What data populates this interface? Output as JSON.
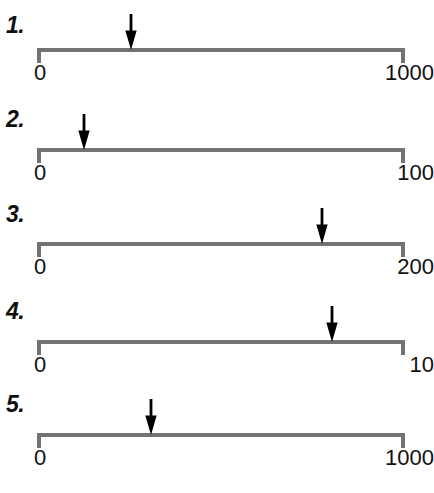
{
  "worksheet": {
    "title": "Estimate the number marked by the arrow on each number line",
    "line_color": "#737373",
    "arrow_color": "#000000",
    "text_color": "#121212"
  },
  "chart_data": {
    "type": "number-line",
    "xlabel": "",
    "ylabel": "",
    "grid": false,
    "legend": null,
    "items": [
      {
        "index": "1.",
        "start_label": "0",
        "end_label": "1000",
        "min": 0,
        "max": 1000,
        "arrow_fraction": 0.255,
        "arrow_value": 255
      },
      {
        "index": "2.",
        "start_label": "0",
        "end_label": "100",
        "min": 0,
        "max": 100,
        "arrow_fraction": 0.128,
        "arrow_value": 13
      },
      {
        "index": "3.",
        "start_label": "0",
        "end_label": "200",
        "min": 0,
        "max": 200,
        "arrow_fraction": 0.774,
        "arrow_value": 155
      },
      {
        "index": "4.",
        "start_label": "0",
        "end_label": "10",
        "min": 0,
        "max": 10,
        "arrow_fraction": 0.802,
        "arrow_value": 8
      },
      {
        "index": "5.",
        "start_label": "0",
        "end_label": "1000",
        "min": 0,
        "max": 1000,
        "arrow_fraction": 0.31,
        "arrow_value": 310
      }
    ],
    "layout": {
      "track_left": 37,
      "track_right": 405,
      "row_line_y": [
        48,
        148,
        242,
        340,
        433
      ],
      "label_y": [
        14,
        108,
        203,
        300,
        393
      ],
      "endpoint_label_y": [
        62,
        162,
        256,
        354,
        447
      ]
    }
  }
}
